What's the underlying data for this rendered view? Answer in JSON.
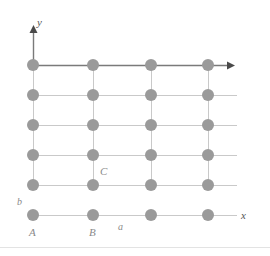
{
  "figure": {
    "name": "two-dimensional-lattice-diagram",
    "background_color": "#ffffff"
  },
  "chart_data": {
    "type": "scatter",
    "title": "",
    "xlabel": "x",
    "ylabel": "y",
    "grid": true,
    "legend": false,
    "lattice": {
      "columns": 4,
      "rows": 6,
      "column_px": [
        33,
        93,
        151,
        208
      ],
      "row_px": [
        65,
        95,
        125,
        155,
        185,
        215
      ],
      "spacing_x_px": 59,
      "spacing_y_px": 30,
      "point_radius_px": 6,
      "point_color": "#9a9a9a",
      "grid_line_color": "#c9c9c9",
      "axis_color": "#7a7a7a"
    },
    "points": [
      {
        "col": 0,
        "row": 0,
        "x": 33,
        "y": 215
      },
      {
        "col": 1,
        "row": 0,
        "x": 93,
        "y": 215
      },
      {
        "col": 2,
        "row": 0,
        "x": 151,
        "y": 215
      },
      {
        "col": 3,
        "row": 0,
        "x": 208,
        "y": 215
      },
      {
        "col": 0,
        "row": 1,
        "x": 33,
        "y": 185
      },
      {
        "col": 1,
        "row": 1,
        "x": 93,
        "y": 185
      },
      {
        "col": 2,
        "row": 1,
        "x": 151,
        "y": 185
      },
      {
        "col": 3,
        "row": 1,
        "x": 208,
        "y": 185
      },
      {
        "col": 0,
        "row": 2,
        "x": 33,
        "y": 155
      },
      {
        "col": 1,
        "row": 2,
        "x": 93,
        "y": 155
      },
      {
        "col": 2,
        "row": 2,
        "x": 151,
        "y": 155
      },
      {
        "col": 3,
        "row": 2,
        "x": 208,
        "y": 155
      },
      {
        "col": 0,
        "row": 3,
        "x": 33,
        "y": 125
      },
      {
        "col": 1,
        "row": 3,
        "x": 93,
        "y": 125
      },
      {
        "col": 2,
        "row": 3,
        "x": 151,
        "y": 125
      },
      {
        "col": 3,
        "row": 3,
        "x": 208,
        "y": 125
      },
      {
        "col": 0,
        "row": 4,
        "x": 33,
        "y": 95
      },
      {
        "col": 1,
        "row": 4,
        "x": 93,
        "y": 95
      },
      {
        "col": 2,
        "row": 4,
        "x": 151,
        "y": 95
      },
      {
        "col": 3,
        "row": 4,
        "x": 208,
        "y": 95
      },
      {
        "col": 0,
        "row": 5,
        "x": 33,
        "y": 65
      },
      {
        "col": 1,
        "row": 5,
        "x": 93,
        "y": 65
      },
      {
        "col": 2,
        "row": 5,
        "x": 151,
        "y": 65
      },
      {
        "col": 3,
        "row": 5,
        "x": 208,
        "y": 65
      }
    ],
    "annotations": [
      {
        "id": "y-axis-label",
        "text": "y",
        "x": 37,
        "y": 26,
        "style": "italic"
      },
      {
        "id": "x-axis-label",
        "text": "x",
        "x": 241,
        "y": 219,
        "style": "italic"
      },
      {
        "id": "point-a-label",
        "text": "A",
        "x": 29,
        "y": 236,
        "style": "italic"
      },
      {
        "id": "point-b-label",
        "text": "B",
        "x": 89,
        "y": 236,
        "style": "italic"
      },
      {
        "id": "point-c-label",
        "text": "C",
        "x": 100,
        "y": 175,
        "style": "italic"
      },
      {
        "id": "vector-a-label",
        "text": "a",
        "x": 118,
        "y": 230,
        "style": "italic"
      },
      {
        "id": "vector-b-label",
        "text": "b",
        "x": 17,
        "y": 205,
        "style": "italic"
      }
    ]
  }
}
